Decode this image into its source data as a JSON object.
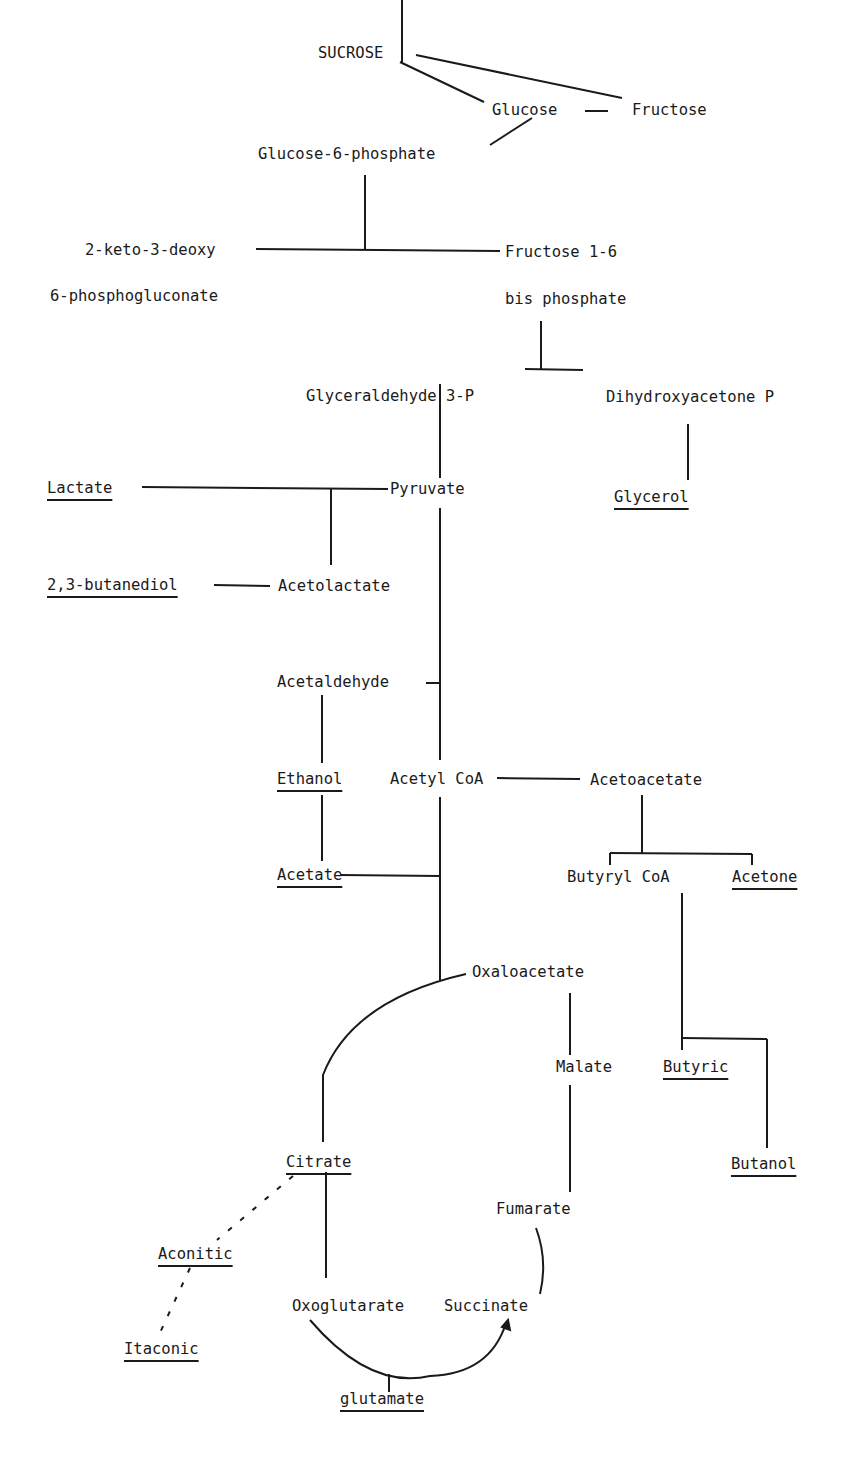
{
  "diagram": {
    "type": "metabolic-pathway",
    "nodes": {
      "sucrose": "SUCROSE",
      "glucose": "Glucose",
      "fructose": "Fructose",
      "glucose6p": "Glucose-6-phosphate",
      "kdpg_line1": "2-keto-3-deoxy",
      "kdpg_line2": "6-phosphogluconate",
      "fbp_line1": "Fructose 1-6",
      "fbp_line2": "bis phosphate",
      "g3p": "Glyceraldehyde 3-P",
      "dhap": "Dihydroxyacetone P",
      "glycerol": "Glycerol",
      "lactate": "Lactate",
      "pyruvate": "Pyruvate",
      "butanediol": "2,3-butanediol",
      "acetolactate": "Acetolactate",
      "acetaldehyde": "Acetaldehyde",
      "ethanol": "Ethanol",
      "acetyl_coa": "Acetyl CoA",
      "acetoacetate": "Acetoacetate",
      "acetate": "Acetate",
      "butyryl_coa": "Butyryl CoA",
      "acetone": "Acetone",
      "oxaloacetate": "Oxaloacetate",
      "malate": "Malate",
      "butyric": "Butyric",
      "butanol": "Butanol",
      "citrate": "Citrate",
      "fumarate": "Fumarate",
      "aconitic": "Aconitic",
      "itaconic": "Itaconic",
      "oxoglutarate": "Oxoglutarate",
      "succinate": "Succinate",
      "glutamate": "glutamate"
    },
    "end_products": [
      "Glycerol",
      "Lactate",
      "2,3-butanediol",
      "Ethanol",
      "Acetate",
      "Acetone",
      "Butyric",
      "Butanol",
      "Citrate",
      "Aconitic",
      "Itaconic",
      "glutamate"
    ],
    "edges": [
      [
        "SUCROSE",
        "Glucose"
      ],
      [
        "SUCROSE",
        "Fructose"
      ],
      [
        "Glucose",
        "Fructose"
      ],
      [
        "Glucose",
        "Glucose-6-phosphate"
      ],
      [
        "Glucose-6-phosphate",
        "2-keto-3-deoxy 6-phosphogluconate"
      ],
      [
        "Glucose-6-phosphate",
        "Fructose 1-6 bis phosphate"
      ],
      [
        "Fructose 1-6 bis phosphate",
        "Glyceraldehyde 3-P"
      ],
      [
        "Fructose 1-6 bis phosphate",
        "Dihydroxyacetone P"
      ],
      [
        "Dihydroxyacetone P",
        "Glycerol"
      ],
      [
        "Glyceraldehyde 3-P",
        "Pyruvate"
      ],
      [
        "Pyruvate",
        "Lactate"
      ],
      [
        "Pyruvate",
        "Acetolactate"
      ],
      [
        "Acetolactate",
        "2,3-butanediol"
      ],
      [
        "Pyruvate",
        "Acetaldehyde"
      ],
      [
        "Acetaldehyde",
        "Ethanol"
      ],
      [
        "Ethanol",
        "Acetate"
      ],
      [
        "Pyruvate",
        "Acetyl CoA"
      ],
      [
        "Acetyl CoA",
        "Acetoacetate"
      ],
      [
        "Acetoacetate",
        "Butyryl CoA"
      ],
      [
        "Acetoacetate",
        "Acetone"
      ],
      [
        "Butyryl CoA",
        "Butyric"
      ],
      [
        "Butyryl CoA",
        "Butanol"
      ],
      [
        "Acetyl CoA",
        "Acetate"
      ],
      [
        "Acetyl CoA",
        "Oxaloacetate"
      ],
      [
        "Oxaloacetate",
        "Citrate"
      ],
      [
        "Oxaloacetate",
        "Malate"
      ],
      [
        "Malate",
        "Fumarate"
      ],
      [
        "Fumarate",
        "Succinate"
      ],
      [
        "Citrate",
        "Oxoglutarate"
      ],
      [
        "Citrate",
        "Aconitic",
        "dashed"
      ],
      [
        "Aconitic",
        "Itaconic",
        "dashed"
      ],
      [
        "Oxoglutarate",
        "Succinate"
      ],
      [
        "Oxoglutarate",
        "glutamate"
      ]
    ]
  }
}
